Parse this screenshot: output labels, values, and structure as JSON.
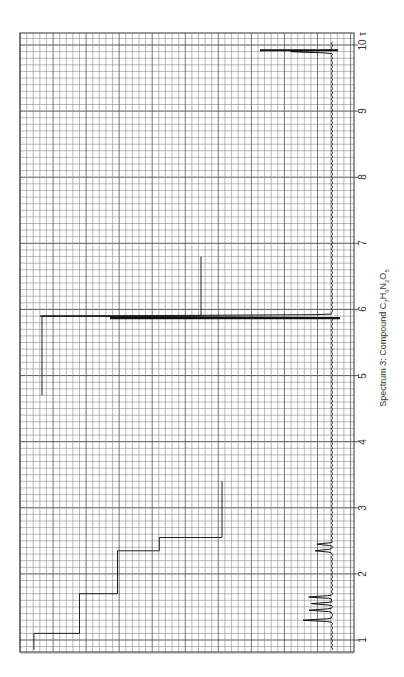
{
  "chart_data": {
    "type": "line",
    "title": "Spectrum 3: Compound C7H6N2O5",
    "caption_parts": {
      "prefix": "Spectrum 3: Compound C",
      "n1": "7",
      "h": "H",
      "n2": "6",
      "n": "N",
      "n3": "2",
      "o": "O",
      "n4": "5"
    },
    "xlabel": "",
    "ylabel": "",
    "orientation": "rotated 90° (chemical shift axis runs top-to-bottom on the right edge)",
    "axis_unit_symbol": "τ",
    "axis": {
      "ticks": [
        1,
        2,
        3,
        4,
        5,
        6,
        7,
        8,
        9,
        10
      ],
      "tick_labels": [
        "1",
        "2",
        "3",
        "4",
        "5",
        "6",
        "7",
        "8",
        "9",
        "10"
      ],
      "range": [
        0.8,
        10.1
      ],
      "minor_divisions_per_unit": 10
    },
    "grid": true,
    "spectrum_peaks": [
      {
        "shift": 5.9,
        "relative_height": 1.0,
        "description": "tall singlet (off-scale)"
      },
      {
        "shift": 9.9,
        "relative_height": 0.14,
        "description": "reference peak"
      },
      {
        "shift": 2.35,
        "relative_height": 0.06,
        "description": "small doublet"
      },
      {
        "shift": 2.45,
        "relative_height": 0.05,
        "description": "small doublet"
      },
      {
        "shift": 1.3,
        "relative_height": 0.1,
        "description": "multiplet"
      },
      {
        "shift": 1.45,
        "relative_height": 0.08,
        "description": "multiplet"
      },
      {
        "shift": 1.55,
        "relative_height": 0.07,
        "description": "multiplet"
      },
      {
        "shift": 1.65,
        "relative_height": 0.08,
        "description": "multiplet"
      }
    ],
    "integration_traces": [
      {
        "region": "0.8-3.4",
        "steps": [
          {
            "from_shift": 3.4,
            "to_shift": 2.55,
            "level": 0.0
          },
          {
            "from_shift": 2.55,
            "to_shift": 2.35,
            "level": 0.33
          },
          {
            "from_shift": 2.35,
            "to_shift": 1.7,
            "level": 0.55
          },
          {
            "from_shift": 1.7,
            "to_shift": 1.1,
            "level": 0.75
          },
          {
            "from_shift": 1.1,
            "to_shift": 0.85,
            "level": 0.99
          }
        ]
      },
      {
        "region": "4.7-6.8",
        "steps": [
          {
            "from_shift": 6.8,
            "to_shift": 5.9,
            "level": 0.0
          },
          {
            "from_shift": 5.9,
            "to_shift": 4.7,
            "level": 1.0
          }
        ]
      }
    ]
  },
  "labels": {
    "tau": "τ"
  }
}
